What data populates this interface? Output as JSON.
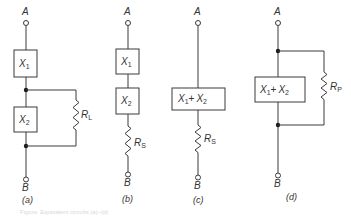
{
  "figure": {
    "caption_faint": "Figure: Equivalent circuits (a)–(d)",
    "circuits": [
      {
        "id": "a",
        "label": "(a)",
        "terminal_top": "A",
        "terminal_bottom": "B",
        "elements": [
          {
            "name": "X",
            "sub": "1"
          },
          {
            "name": "X",
            "sub": "2"
          }
        ],
        "resistor": {
          "name": "R",
          "sub": "L",
          "connection": "parallel with X2"
        }
      },
      {
        "id": "b",
        "label": "(b)",
        "terminal_top": "A",
        "terminal_bottom": "B",
        "elements": [
          {
            "name": "X",
            "sub": "1"
          },
          {
            "name": "X",
            "sub": "2"
          }
        ],
        "resistor": {
          "name": "R",
          "sub": "S",
          "connection": "series"
        }
      },
      {
        "id": "c",
        "label": "(c)",
        "terminal_top": "A",
        "terminal_bottom": "B",
        "elements": [
          {
            "text": "X1 + X2",
            "parts": [
              {
                "name": "X",
                "sub": "1"
              },
              {
                "op": "+"
              },
              {
                "name": "X",
                "sub": "2"
              }
            ]
          }
        ],
        "resistor": {
          "name": "R",
          "sub": "S",
          "connection": "series"
        }
      },
      {
        "id": "d",
        "label": "(d)",
        "terminal_top": "A",
        "terminal_bottom": "B",
        "elements": [
          {
            "text": "X1 + X2",
            "parts": [
              {
                "name": "X",
                "sub": "1"
              },
              {
                "op": "+"
              },
              {
                "name": "X",
                "sub": "2"
              }
            ]
          }
        ],
        "resistor": {
          "name": "R",
          "sub": "P",
          "connection": "parallel"
        }
      }
    ]
  },
  "colors": {
    "line": "#3a3a3a",
    "text": "#333333",
    "background": "#ffffff"
  }
}
